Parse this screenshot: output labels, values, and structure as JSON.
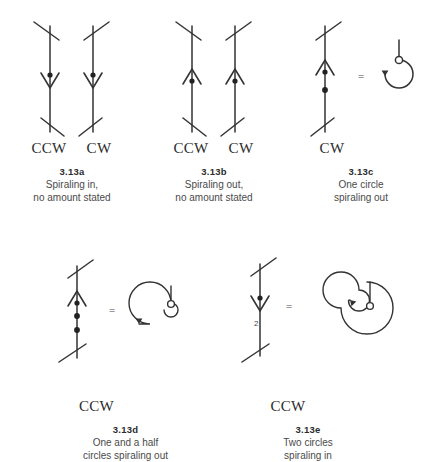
{
  "page": {
    "ink_color": "#333333",
    "text_color": "#3a3a3a",
    "background": "#ffffff"
  },
  "figures": [
    {
      "id": "3.13a",
      "caption_number": "3.13a",
      "caption_text": "Spiraling in,\nno amount stated",
      "directions": [
        "CCW",
        "CW"
      ],
      "symbols": [
        {
          "name": "spiraling-in-ccw",
          "chevron": "down",
          "dots": 1,
          "amount": "",
          "handedness": "ccw"
        },
        {
          "name": "spiraling-in-cw",
          "chevron": "down",
          "dots": 1,
          "amount": "",
          "handedness": "cw"
        }
      ],
      "equation": false
    },
    {
      "id": "3.13b",
      "caption_number": "3.13b",
      "caption_text": "Spiraling out,\nno amount stated",
      "directions": [
        "CCW",
        "CW"
      ],
      "symbols": [
        {
          "name": "spiraling-out-ccw",
          "chevron": "up",
          "dots": 1,
          "amount": "",
          "handedness": "ccw"
        },
        {
          "name": "spiraling-out-cw",
          "chevron": "up",
          "dots": 1,
          "amount": "",
          "handedness": "cw"
        }
      ],
      "equation": false
    },
    {
      "id": "3.13c",
      "caption_number": "3.13c",
      "caption_text": "One circle\nspiraling out",
      "directions": [
        "CW"
      ],
      "symbols": [
        {
          "name": "one-circle-spiraling-out",
          "chevron": "up",
          "dots": 2,
          "amount": "",
          "handedness": "cw"
        }
      ],
      "equation": true,
      "equals_label": "=",
      "path_diagram": {
        "name": "one-circle-path",
        "turns": 1,
        "direction": "out",
        "rotation": "cw"
      }
    },
    {
      "id": "3.13d",
      "caption_number": "3.13d",
      "caption_text": "One and a half\ncircles spiraling out",
      "directions": [
        "CCW"
      ],
      "symbols": [
        {
          "name": "one-and-half-circles-spiraling-out",
          "chevron": "up",
          "dots": 3,
          "amount": "",
          "handedness": "ccw"
        }
      ],
      "equation": true,
      "equals_label": "=",
      "path_diagram": {
        "name": "one-and-half-circle-path",
        "turns": 1.5,
        "direction": "out",
        "rotation": "ccw"
      }
    },
    {
      "id": "3.13e",
      "caption_number": "3.13e",
      "caption_text": "Two circles\nspiraling in",
      "directions": [
        "CCW"
      ],
      "symbols": [
        {
          "name": "two-circles-spiraling-in",
          "chevron": "down",
          "dots": 1,
          "amount": "2",
          "handedness": "ccw"
        }
      ],
      "equation": true,
      "equals_label": "=",
      "path_diagram": {
        "name": "two-circle-path",
        "turns": 2,
        "direction": "in",
        "rotation": "ccw"
      }
    }
  ]
}
